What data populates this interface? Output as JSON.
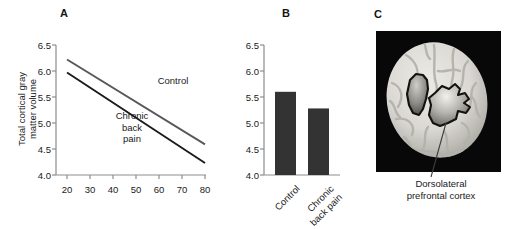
{
  "figure": {
    "panels": [
      {
        "letter": "A"
      },
      {
        "letter": "B"
      },
      {
        "letter": "C"
      }
    ]
  },
  "panel_a": {
    "letter": "A",
    "ylabel_line1": "Total cortical gray",
    "ylabel_line2": "matter volume",
    "xlabel": "Age (years)",
    "yticks": [
      "6.5",
      "6.0",
      "5.5",
      "5.0",
      "4.5",
      "4.0"
    ],
    "xticks": [
      "20",
      "30",
      "40",
      "50",
      "60",
      "70",
      "80"
    ],
    "series_label_control": "Control",
    "series_label_cbp_line1": "Chronic",
    "series_label_cbp_line2": "back",
    "series_label_cbp_line3": "pain",
    "color_control": "#58585a",
    "color_cbp": "#1a1a1a",
    "axis_color": "#8d8d8d"
  },
  "panel_b": {
    "letter": "B",
    "yticks": [
      "6.5",
      "6.0",
      "5.5",
      "5.0",
      "4.5",
      "4.0"
    ],
    "cat_label_0": "Control",
    "cat_label_1_line1": "Chronic",
    "cat_label_1_line2": "back pain",
    "bar_color": "#333333",
    "axis_color": "#8d8d8d"
  },
  "panel_c": {
    "letter": "C",
    "caption_line1": "Dorsolateral",
    "caption_line2": "prefrontal cortex",
    "background_color": "#080808",
    "brain_color": "#d9d8d4",
    "roi_color": "#9d9c97",
    "leader_color": "#3c3c3c"
  },
  "chart_data": [
    {
      "type": "line",
      "panel": "A",
      "title": "",
      "xlabel": "Age (years)",
      "ylabel": "Total cortical gray matter volume",
      "xlim": [
        20,
        80
      ],
      "ylim": [
        4.0,
        6.5
      ],
      "xticks": [
        20,
        30,
        40,
        50,
        60,
        70,
        80
      ],
      "yticks": [
        4.0,
        4.5,
        5.0,
        5.5,
        6.0,
        6.5
      ],
      "grid": false,
      "legend": "inline-annotations",
      "series": [
        {
          "name": "Control",
          "x": [
            20,
            80
          ],
          "values": [
            6.22,
            4.59
          ],
          "color": "#58585a"
        },
        {
          "name": "Chronic back pain",
          "x": [
            20,
            80
          ],
          "values": [
            5.97,
            4.23
          ],
          "color": "#1a1a1a"
        }
      ]
    },
    {
      "type": "bar",
      "panel": "B",
      "title": "",
      "xlabel": "",
      "ylabel": "",
      "categories": [
        "Control",
        "Chronic back pain"
      ],
      "values": [
        5.6,
        5.28
      ],
      "ylim": [
        4.0,
        6.5
      ],
      "yticks": [
        4.0,
        4.5,
        5.0,
        5.5,
        6.0,
        6.5
      ],
      "grid": false,
      "legend": "none"
    }
  ]
}
